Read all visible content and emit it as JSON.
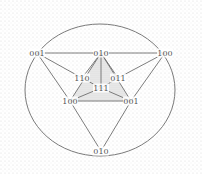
{
  "diagram": {
    "type": "hypercube-graph-projection",
    "colors": {
      "background": "#ffffff",
      "texture_dot": "#d9d9d9",
      "edge": "#6e6e6e",
      "ellipse": "#7a7a7a",
      "label": "#555555",
      "shaded_fill": "#e6e6e6"
    },
    "ellipse": {
      "cx": 100,
      "cy": 90,
      "rx": 75,
      "ry": 66
    },
    "nodes": [
      {
        "id": "outer_001",
        "label": "001",
        "x": 37,
        "y": 53
      },
      {
        "id": "top_010",
        "label": "010",
        "x": 101,
        "y": 53
      },
      {
        "id": "outer_100",
        "label": "100",
        "x": 165,
        "y": 53
      },
      {
        "id": "n110",
        "label": "110",
        "x": 82,
        "y": 78
      },
      {
        "id": "n011",
        "label": "011",
        "x": 118,
        "y": 78
      },
      {
        "id": "n111",
        "label": "111",
        "x": 101,
        "y": 88
      },
      {
        "id": "inner_100",
        "label": "100",
        "x": 70,
        "y": 101
      },
      {
        "id": "inner_001",
        "label": "001",
        "x": 131,
        "y": 101
      },
      {
        "id": "bottom_010",
        "label": "010",
        "x": 101,
        "y": 151
      }
    ],
    "edges": [
      [
        "outer_001",
        "top_010"
      ],
      [
        "top_010",
        "outer_100"
      ],
      [
        "outer_001",
        "n110"
      ],
      [
        "outer_001",
        "inner_100"
      ],
      [
        "outer_100",
        "n011"
      ],
      [
        "outer_100",
        "inner_001"
      ],
      [
        "top_010",
        "n110"
      ],
      [
        "top_010",
        "n111"
      ],
      [
        "top_010",
        "n011"
      ],
      [
        "top_010",
        "inner_100"
      ],
      [
        "top_010",
        "inner_001"
      ],
      [
        "n110",
        "n111"
      ],
      [
        "n011",
        "n111"
      ],
      [
        "n111",
        "inner_100"
      ],
      [
        "n111",
        "inner_001"
      ],
      [
        "inner_100",
        "inner_001"
      ],
      [
        "inner_100",
        "bottom_010"
      ],
      [
        "inner_001",
        "bottom_010"
      ]
    ],
    "shaded_region": [
      "top_010",
      "inner_100",
      "inner_001"
    ]
  }
}
